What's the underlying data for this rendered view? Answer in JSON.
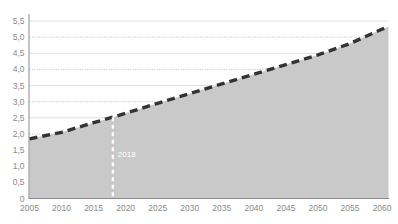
{
  "chart_data": {
    "type": "area",
    "title": "",
    "subtitle": "",
    "xlabel": "",
    "ylabel": "",
    "xlim": [
      2005,
      2061
    ],
    "ylim": [
      0,
      5.75
    ],
    "grid": true,
    "legend": null,
    "decimal_separator": ",",
    "x_tick_labels": [
      "2005",
      "2010",
      "2015",
      "2020",
      "2025",
      "2030",
      "2035",
      "2040",
      "2045",
      "2050",
      "2055",
      "2060"
    ],
    "x_tick_values": [
      2005,
      2010,
      2015,
      2020,
      2025,
      2030,
      2035,
      2040,
      2045,
      2050,
      2055,
      2060
    ],
    "y_tick_labels": [
      "0",
      "0,5",
      "1,0",
      "1,5",
      "2,0",
      "2,5",
      "3,0",
      "3,5",
      "4,0",
      "4,5",
      "5,0",
      "5,5"
    ],
    "y_tick_values": [
      0,
      0.5,
      1.0,
      1.5,
      2.0,
      2.5,
      3.0,
      3.5,
      4.0,
      4.5,
      5.0,
      5.5
    ],
    "series": [
      {
        "name": "projection",
        "style": "dashed-line-with-area-fill",
        "line_color": "#333333",
        "fill_color": "#c9c9c9",
        "x": [
          2005,
          2010,
          2015,
          2018,
          2020,
          2025,
          2030,
          2035,
          2040,
          2045,
          2050,
          2055,
          2060,
          2061
        ],
        "values": [
          1.85,
          2.05,
          2.35,
          2.52,
          2.64,
          2.95,
          3.25,
          3.55,
          3.85,
          4.15,
          4.45,
          4.8,
          5.25,
          5.32
        ]
      }
    ],
    "annotations": [
      {
        "name": "year-marker-2018",
        "label": "2018",
        "x": 2018,
        "line_style": "dashed",
        "line_color": "#ffffff",
        "label_color": "#ffffff"
      }
    ],
    "colors": {
      "area_fill": "#c9c9c9",
      "line": "#333333",
      "gridline_solid": "#d8d8d8",
      "gridline_dotted": "#b9b9b9",
      "axis": "#8a8a8a",
      "tick_label": "#8a8a8a",
      "marker": "#ffffff",
      "background": "#ffffff"
    }
  }
}
